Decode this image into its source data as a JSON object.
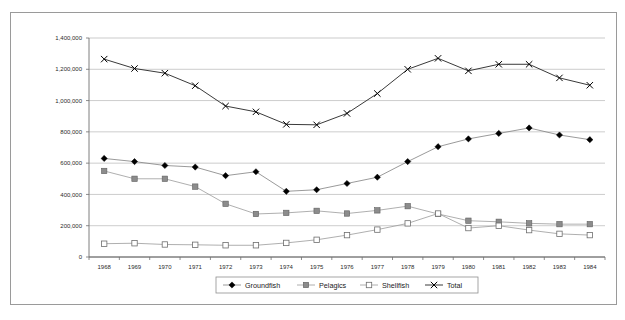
{
  "figure": {
    "frame_border_color": "#9a9a9a",
    "background": "#ffffff"
  },
  "chart_data": {
    "type": "line",
    "title": "",
    "subtitle": "",
    "xlabel": "",
    "ylabel": "",
    "grid": true,
    "legend_position": "bottom",
    "xlim": [
      "1968",
      "1984"
    ],
    "ylim": [
      0,
      1400000
    ],
    "ytick_step": 200000,
    "ytick_labels": [
      "0",
      "200,000",
      "400,000",
      "600,000",
      "800,000",
      "1,000,000",
      "1,200,000",
      "1,400,000"
    ],
    "ytick_values": [
      0,
      200000,
      400000,
      600000,
      800000,
      1000000,
      1200000,
      1400000
    ],
    "categories": [
      "1968",
      "1969",
      "1970",
      "1971",
      "1972",
      "1973",
      "1974",
      "1975",
      "1976",
      "1977",
      "1978",
      "1979",
      "1980",
      "1981",
      "1982",
      "1983",
      "1984"
    ],
    "series": [
      {
        "name": "Groundfish",
        "marker": "filled-diamond",
        "color": "#000000",
        "line_color": "#808080",
        "values": [
          630000,
          610000,
          585000,
          575000,
          520000,
          545000,
          420000,
          430000,
          470000,
          510000,
          610000,
          705000,
          755000,
          790000,
          825000,
          780000,
          750000
        ]
      },
      {
        "name": "Pelagics",
        "marker": "filled-square",
        "color": "#808080",
        "line_color": "#9a9a9a",
        "values": [
          550000,
          500000,
          500000,
          450000,
          340000,
          275000,
          282000,
          295000,
          278000,
          298000,
          325000,
          275000,
          232000,
          225000,
          215000,
          210000,
          210000
        ]
      },
      {
        "name": "Shellfish",
        "marker": "open-square",
        "color": "#ffffff",
        "line_color": "#9a9a9a",
        "values": [
          85000,
          88000,
          80000,
          78000,
          75000,
          75000,
          90000,
          110000,
          140000,
          175000,
          215000,
          278000,
          185000,
          200000,
          172000,
          148000,
          140000
        ]
      },
      {
        "name": "Total",
        "marker": "cross-x",
        "color": "#000000",
        "line_color": "#3a3a3a",
        "values": [
          1265000,
          1205000,
          1175000,
          1095000,
          965000,
          928000,
          848000,
          845000,
          918000,
          1045000,
          1200000,
          1270000,
          1190000,
          1232000,
          1232000,
          1145000,
          1098000
        ]
      }
    ],
    "legend_entries": [
      {
        "label": "Groundfish",
        "marker": "filled-diamond"
      },
      {
        "label": "Pelagics",
        "marker": "filled-square"
      },
      {
        "label": "Shellfish",
        "marker": "open-square"
      },
      {
        "label": "Total",
        "marker": "cross-x"
      }
    ]
  },
  "caption": {
    "text": ""
  }
}
